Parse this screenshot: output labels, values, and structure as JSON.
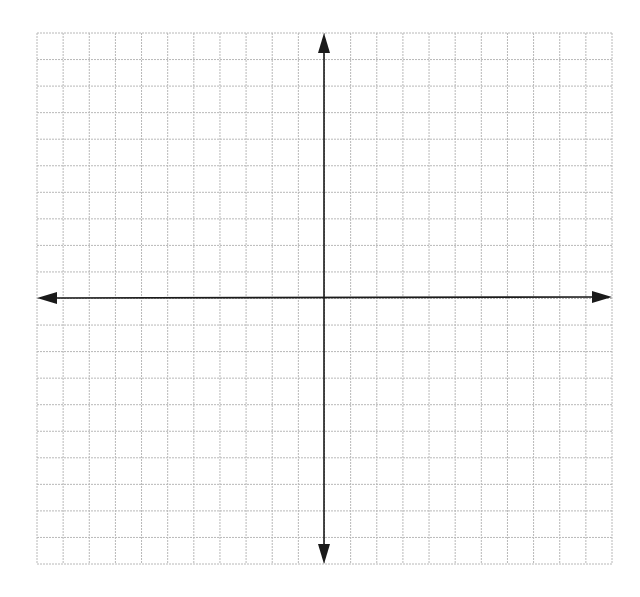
{
  "diagram": {
    "type": "coordinate-plane",
    "grid": {
      "columns": 22,
      "rows": 20,
      "left": 37,
      "top": 33,
      "right": 612,
      "bottom": 564,
      "line_color": "#b8b8b8"
    },
    "axes": {
      "color": "#1a1a1a",
      "x_axis": {
        "y": 298,
        "x_start": 37,
        "x_end": 612,
        "arrows": [
          "left",
          "right"
        ]
      },
      "y_axis": {
        "x": 324,
        "y_start": 33,
        "y_end": 564,
        "arrows": [
          "up",
          "down"
        ]
      }
    },
    "labels": []
  }
}
